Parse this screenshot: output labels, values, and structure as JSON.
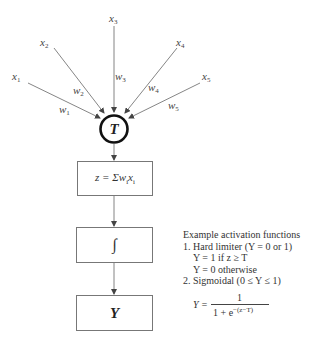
{
  "diagram": {
    "inputs": [
      {
        "label": "x",
        "sub": "1",
        "weight": "w",
        "weight_sub": "1"
      },
      {
        "label": "x",
        "sub": "2",
        "weight": "w",
        "weight_sub": "2"
      },
      {
        "label": "x",
        "sub": "3",
        "weight": "w",
        "weight_sub": "3"
      },
      {
        "label": "x",
        "sub": "4",
        "weight": "w",
        "weight_sub": "4"
      },
      {
        "label": "x",
        "sub": "5",
        "weight": "w",
        "weight_sub": "5"
      }
    ],
    "node": {
      "label": "T"
    },
    "summation_box": {
      "prefix": "z = Σ",
      "w": "w",
      "w_sub": "i",
      "x": "x",
      "x_sub": "i"
    },
    "activation_box": {
      "symbol": "∫"
    },
    "output_box": {
      "label": "Y"
    },
    "notes": {
      "heading": "Example activation functions",
      "item1": "1. Hard limiter (Y = 0 or 1)",
      "item1_line1": "Y = 1 if z ≥ T",
      "item1_line2": "Y = 0 otherwise",
      "item2": "2. Sigmoidal (0 ≤ Y ≤ 1)",
      "sigmoid_lhs": "Y =",
      "sigmoid_num": "1",
      "sigmoid_den": "1 + e",
      "sigmoid_exp": "−(z−T)"
    },
    "colors": {
      "line": "#555555",
      "node_stroke": "#111111",
      "box_border": "#777777"
    }
  }
}
